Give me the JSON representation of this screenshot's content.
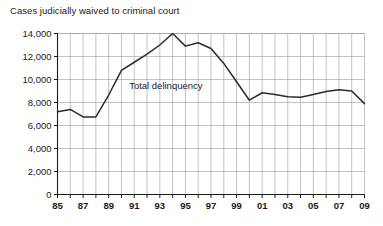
{
  "chart_data": {
    "type": "line",
    "title": "Cases judicially waived to criminal court",
    "xlabel": "",
    "ylabel": "",
    "ylim": [
      0,
      14000
    ],
    "yticks": [
      0,
      2000,
      4000,
      6000,
      8000,
      10000,
      12000,
      14000
    ],
    "ytick_labels": [
      "0",
      "2,000",
      "4,000",
      "6,000",
      "8,000",
      "10,000",
      "12,000",
      "14,000"
    ],
    "grid": true,
    "legend_position": "inline-annotation",
    "annotations": [
      {
        "text": "Total delinquency",
        "x": 1990.6,
        "y": 9150
      }
    ],
    "x": [
      1985,
      1986,
      1987,
      1988,
      1989,
      1990,
      1991,
      1992,
      1993,
      1994,
      1995,
      1996,
      1997,
      1998,
      1999,
      2000,
      2001,
      2002,
      2003,
      2004,
      2005,
      2006,
      2007,
      2008,
      2009
    ],
    "xtick_labels": [
      "85",
      "86",
      "87",
      "88",
      "89",
      "90",
      "91",
      "92",
      "93",
      "94",
      "95",
      "96",
      "97",
      "98",
      "99",
      "00",
      "01",
      "02",
      "03",
      "04",
      "05",
      "06",
      "07",
      "08",
      "09"
    ],
    "xtick_labels_shown": [
      "85",
      "",
      "87",
      "",
      "89",
      "",
      "91",
      "",
      "93",
      "",
      "95",
      "",
      "97",
      "",
      "99",
      "",
      "01",
      "",
      "03",
      "",
      "05",
      "",
      "07",
      "",
      "09"
    ],
    "series": [
      {
        "name": "Total delinquency",
        "values": [
          7200,
          7400,
          6750,
          6750,
          8650,
          10800,
          11500,
          12200,
          13000,
          14000,
          12900,
          13200,
          12700,
          11400,
          9800,
          8200,
          8850,
          8700,
          8500,
          8450,
          8700,
          8950,
          9100,
          9000,
          7900
        ]
      }
    ]
  },
  "axis": {
    "y_axis_name": "y-axis",
    "x_axis_name": "x-axis"
  }
}
